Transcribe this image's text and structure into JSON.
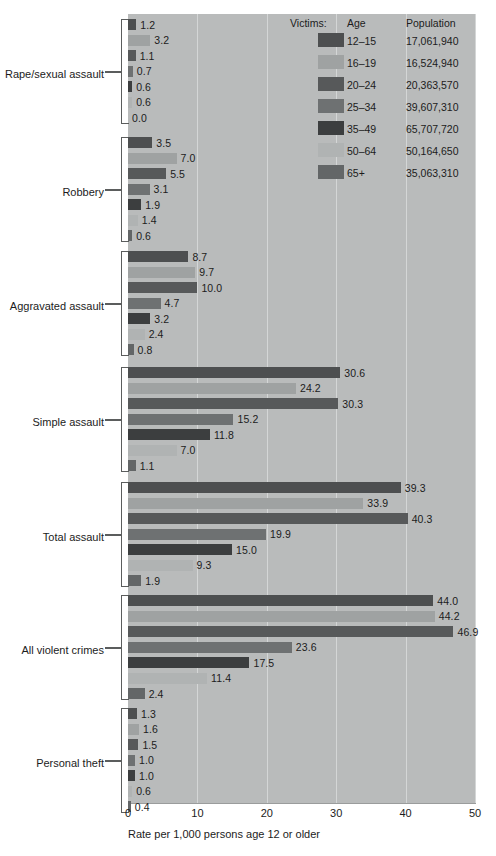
{
  "chart_data": {
    "type": "bar",
    "orientation": "horizontal",
    "title": "",
    "xlabel": "Rate per 1,000 persons age 12 or older",
    "ylabel": "",
    "xlim": [
      0,
      50
    ],
    "xticks": [
      0,
      10,
      20,
      30,
      40,
      50
    ],
    "xtick_labels": [
      "0",
      "10",
      "20",
      "30",
      "40",
      "50"
    ],
    "grid": true,
    "legend_position": "top-right",
    "legend_title": "Victims:",
    "legend_columns": [
      "Victims:",
      "Age",
      "Population"
    ],
    "series": [
      {
        "name": "12–15",
        "population": "17,061,940",
        "color": "#4d4f50",
        "values": [
          1.2,
          3.5,
          8.7,
          30.6,
          39.3,
          44.0,
          1.3
        ]
      },
      {
        "name": "16–19",
        "population": "16,524,940",
        "color": "#9fa2a2",
        "values": [
          3.2,
          7.0,
          9.7,
          24.2,
          33.9,
          44.2,
          1.6
        ]
      },
      {
        "name": "20–24",
        "population": "20,363,570",
        "color": "#57595a",
        "values": [
          1.1,
          5.5,
          10.0,
          30.3,
          40.3,
          46.9,
          1.5
        ]
      },
      {
        "name": "25–34",
        "population": "39,607,310",
        "color": "#6e7172",
        "values": [
          0.7,
          3.1,
          4.7,
          15.2,
          19.9,
          23.6,
          1.0
        ]
      },
      {
        "name": "35–49",
        "population": "65,707,720",
        "color": "#3c3e3f",
        "values": [
          0.6,
          1.9,
          3.2,
          11.8,
          15.0,
          17.5,
          1.0
        ]
      },
      {
        "name": "50–64",
        "population": "50,164,650",
        "color": "#b0b3b3",
        "values": [
          0.6,
          1.4,
          2.4,
          7.0,
          9.3,
          11.4,
          0.6
        ]
      },
      {
        "name": "65+",
        "population": "35,063,310",
        "color": "#63666 7",
        "values": [
          0.0,
          0.6,
          0.8,
          1.1,
          1.9,
          2.4,
          0.4
        ]
      }
    ],
    "categories": [
      "Rape/sexual assault",
      "Robbery",
      "Aggravated assault",
      "Simple assault",
      "Total assault",
      "All violent crimes",
      "Personal theft"
    ],
    "groups": [
      {
        "label": "Rape/sexual assault",
        "bars": [
          {
            "age": "12–15",
            "value": 1.2,
            "label": "1.2",
            "color": "#4d4f50"
          },
          {
            "age": "16–19",
            "value": 3.2,
            "label": "3.2",
            "color": "#9fa2a2"
          },
          {
            "age": "20–24",
            "value": 1.1,
            "label": "1.1",
            "color": "#57595a"
          },
          {
            "age": "25–34",
            "value": 0.7,
            "label": "0.7",
            "color": "#6e7172"
          },
          {
            "age": "35–49",
            "value": 0.6,
            "label": "0.6",
            "color": "#3c3e3f"
          },
          {
            "age": "50–64",
            "value": 0.6,
            "label": "0.6",
            "color": "#b0b3b3"
          },
          {
            "age": "65+",
            "value": 0.0,
            "label": "0.0",
            "color": "#636667"
          }
        ]
      },
      {
        "label": "Robbery",
        "bars": [
          {
            "age": "12–15",
            "value": 3.5,
            "label": "3.5",
            "color": "#4d4f50"
          },
          {
            "age": "16–19",
            "value": 7.0,
            "label": "7.0",
            "color": "#9fa2a2"
          },
          {
            "age": "20–24",
            "value": 5.5,
            "label": "5.5",
            "color": "#57595a"
          },
          {
            "age": "25–34",
            "value": 3.1,
            "label": "3.1",
            "color": "#6e7172"
          },
          {
            "age": "35–49",
            "value": 1.9,
            "label": "1.9",
            "color": "#3c3e3f"
          },
          {
            "age": "50–64",
            "value": 1.4,
            "label": "1.4",
            "color": "#b0b3b3"
          },
          {
            "age": "65+",
            "value": 0.6,
            "label": "0.6",
            "color": "#636667"
          }
        ]
      },
      {
        "label": "Aggravated assault",
        "bars": [
          {
            "age": "12–15",
            "value": 8.7,
            "label": "8.7",
            "color": "#4d4f50"
          },
          {
            "age": "16–19",
            "value": 9.7,
            "label": "9.7",
            "color": "#9fa2a2"
          },
          {
            "age": "20–24",
            "value": 10.0,
            "label": "10.0",
            "color": "#57595a"
          },
          {
            "age": "25–34",
            "value": 4.7,
            "label": "4.7",
            "color": "#6e7172"
          },
          {
            "age": "35–49",
            "value": 3.2,
            "label": "3.2",
            "color": "#3c3e3f"
          },
          {
            "age": "50–64",
            "value": 2.4,
            "label": "2.4",
            "color": "#b0b3b3"
          },
          {
            "age": "65+",
            "value": 0.8,
            "label": "0.8",
            "color": "#636667"
          }
        ]
      },
      {
        "label": "Simple assault",
        "bars": [
          {
            "age": "12–15",
            "value": 30.6,
            "label": "30.6",
            "color": "#4d4f50"
          },
          {
            "age": "16–19",
            "value": 24.2,
            "label": "24.2",
            "color": "#9fa2a2"
          },
          {
            "age": "20–24",
            "value": 30.3,
            "label": "30.3",
            "color": "#57595a"
          },
          {
            "age": "25–34",
            "value": 15.2,
            "label": "15.2",
            "color": "#6e7172"
          },
          {
            "age": "35–49",
            "value": 11.8,
            "label": "11.8",
            "color": "#3c3e3f"
          },
          {
            "age": "50–64",
            "value": 7.0,
            "label": "7.0",
            "color": "#b0b3b3"
          },
          {
            "age": "65+",
            "value": 1.1,
            "label": "1.1",
            "color": "#636667"
          }
        ]
      },
      {
        "label": "Total assault",
        "bars": [
          {
            "age": "12–15",
            "value": 39.3,
            "label": "39.3",
            "color": "#4d4f50"
          },
          {
            "age": "16–19",
            "value": 33.9,
            "label": "33.9",
            "color": "#9fa2a2"
          },
          {
            "age": "20–24",
            "value": 40.3,
            "label": "40.3",
            "color": "#57595a"
          },
          {
            "age": "25–34",
            "value": 19.9,
            "label": "19.9",
            "color": "#6e7172"
          },
          {
            "age": "35–49",
            "value": 15.0,
            "label": "15.0",
            "color": "#3c3e3f"
          },
          {
            "age": "50–64",
            "value": 9.3,
            "label": "9.3",
            "color": "#b0b3b3"
          },
          {
            "age": "65+",
            "value": 1.9,
            "label": "1.9",
            "color": "#636667"
          }
        ]
      },
      {
        "label": "All violent crimes",
        "bars": [
          {
            "age": "12–15",
            "value": 44.0,
            "label": "44.0",
            "color": "#4d4f50"
          },
          {
            "age": "16–19",
            "value": 44.2,
            "label": "44.2",
            "color": "#9fa2a2"
          },
          {
            "age": "20–24",
            "value": 46.9,
            "label": "46.9",
            "color": "#57595a"
          },
          {
            "age": "25–34",
            "value": 23.6,
            "label": "23.6",
            "color": "#6e7172"
          },
          {
            "age": "35–49",
            "value": 17.5,
            "label": "17.5",
            "color": "#3c3e3f"
          },
          {
            "age": "50–64",
            "value": 11.4,
            "label": "11.4",
            "color": "#b0b3b3"
          },
          {
            "age": "65+",
            "value": 2.4,
            "label": "2.4",
            "color": "#636667"
          }
        ]
      },
      {
        "label": "Personal theft",
        "bars": [
          {
            "age": "12–15",
            "value": 1.3,
            "label": "1.3",
            "color": "#4d4f50"
          },
          {
            "age": "16–19",
            "value": 1.6,
            "label": "1.6",
            "color": "#9fa2a2"
          },
          {
            "age": "20–24",
            "value": 1.5,
            "label": "1.5",
            "color": "#57595a"
          },
          {
            "age": "25–34",
            "value": 1.0,
            "label": "1.0",
            "color": "#6e7172"
          },
          {
            "age": "35–49",
            "value": 1.0,
            "label": "1.0",
            "color": "#3c3e3f"
          },
          {
            "age": "50–64",
            "value": 0.6,
            "label": "0.6",
            "color": "#b0b3b3"
          },
          {
            "age": "65+",
            "value": 0.4,
            "label": "0.4",
            "color": "#636667"
          }
        ]
      }
    ],
    "legend": {
      "header": {
        "victims": "Victims:",
        "age": "Age",
        "population": "Population"
      },
      "rows": [
        {
          "age": "12–15",
          "population": "17,061,940",
          "color": "#4d4f50"
        },
        {
          "age": "16–19",
          "population": "16,524,940",
          "color": "#9fa2a2"
        },
        {
          "age": "20–24",
          "population": "20,363,570",
          "color": "#57595a"
        },
        {
          "age": "25–34",
          "population": "39,607,310",
          "color": "#6e7172"
        },
        {
          "age": "35–49",
          "population": "65,707,720",
          "color": "#3c3e3f"
        },
        {
          "age": "50–64",
          "population": "50,164,650",
          "color": "#b0b3b3"
        },
        {
          "age": "65+",
          "population": "35,063,310",
          "color": "#636667"
        }
      ]
    }
  },
  "colors": {
    "panel_background": "#b9bbbb",
    "gridline": "#d4d6d6",
    "page_background": "#ffffff",
    "text": "#1c1c1c",
    "bracket": "#5b5d5d"
  }
}
